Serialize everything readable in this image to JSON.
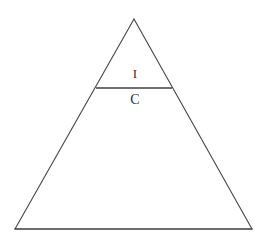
{
  "figure": {
    "title": "",
    "background_color": "#ffffff",
    "width": 266,
    "height": 244,
    "stroke_color": "#4a4a4a",
    "base_stroke_color": "#3d3d3d",
    "label_color": "#2f2f2f"
  },
  "partial_header": {
    "text": "cut-off-text-row"
  },
  "labels": {
    "upper": "I",
    "lower": "C"
  },
  "chart_data": {
    "type": "diagram",
    "title": "",
    "shape": "triangle",
    "vertices": {
      "apex": [
        134,
        19
      ],
      "bottom_left": [
        15,
        229
      ],
      "bottom_right": [
        252,
        229
      ]
    },
    "divider_line": {
      "from": [
        96,
        88
      ],
      "to": [
        172,
        88
      ],
      "y": 88
    },
    "regions": [
      {
        "label": "I",
        "position": [
          134,
          74
        ],
        "location": "above-divider",
        "relative_size": "small"
      },
      {
        "label": "C",
        "position": [
          134,
          101
        ],
        "location": "below-divider",
        "relative_size": "large"
      }
    ],
    "xlabel": "",
    "ylabel": "",
    "legend": []
  }
}
